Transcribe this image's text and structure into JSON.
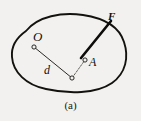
{
  "figure": {
    "caption": "(a)",
    "background_color": "#f2f1ef",
    "ink_color": "#14120f",
    "width": 141,
    "height": 121
  },
  "labels": {
    "pivot": "O",
    "moment_arm": "d",
    "application_point": "A",
    "force": "F"
  },
  "geometry": {
    "body_outline": "M 26,31 C 38,16 62,12 83,15 C 103,18 119,26 124,42 C 129,57 126,73 112,83 C 96,94 68,94 46,89 C 26,85 13,72 12,57 C 11,46 16,38 26,31 Z",
    "points": {
      "O": {
        "x": 34,
        "y": 47
      },
      "foot": {
        "x": 72,
        "y": 78
      },
      "A": {
        "x": 85,
        "y": 60
      }
    },
    "moment_arm_line": {
      "x1": 34,
      "y1": 47,
      "x2": 72,
      "y2": 78
    },
    "line_of_action_dashed": {
      "x1": 72,
      "y1": 78,
      "x2": 85,
      "y2": 60
    },
    "force_vector": {
      "x1": 81,
      "y1": 58,
      "x2": 111,
      "y2": 21
    },
    "marker_radius": 2.1
  }
}
